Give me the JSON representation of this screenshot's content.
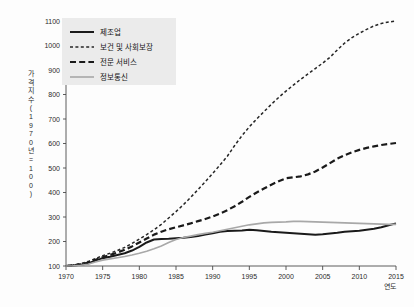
{
  "chart_data": {
    "type": "line",
    "title": "",
    "xlabel": "연도",
    "ylabel": "가격지수(1970년=100)",
    "ylabel_chars": [
      "가",
      "격",
      "지",
      "수",
      "(",
      "1",
      "9",
      "7",
      "0",
      "년",
      "=",
      "1",
      "0",
      "0",
      ")"
    ],
    "xlim": [
      1970,
      2015
    ],
    "ylim": [
      100,
      1100
    ],
    "xticks": [
      1970,
      1975,
      1980,
      1985,
      1990,
      1995,
      2000,
      2005,
      2010,
      2015
    ],
    "yticks": [
      100,
      200,
      300,
      400,
      500,
      600,
      700,
      800,
      900,
      1000,
      1100
    ],
    "grid": false,
    "legend_position": "top-left",
    "x": [
      1970,
      1971,
      1972,
      1973,
      1974,
      1975,
      1976,
      1977,
      1978,
      1979,
      1980,
      1981,
      1982,
      1983,
      1984,
      1985,
      1986,
      1987,
      1988,
      1989,
      1990,
      1991,
      1992,
      1993,
      1994,
      1995,
      1996,
      1997,
      1998,
      1999,
      2000,
      2001,
      2002,
      2003,
      2004,
      2005,
      2006,
      2007,
      2008,
      2009,
      2010,
      2011,
      2012,
      2013,
      2014,
      2015
    ],
    "series": [
      {
        "name": "제조업",
        "style": "solid",
        "color": "#1a1a1a",
        "width": 2.0,
        "values": [
          100,
          102,
          105,
          110,
          122,
          132,
          138,
          145,
          152,
          163,
          178,
          196,
          208,
          210,
          211,
          213,
          215,
          218,
          222,
          228,
          234,
          240,
          243,
          244,
          245,
          248,
          246,
          243,
          240,
          238,
          236,
          234,
          232,
          230,
          228,
          230,
          233,
          236,
          240,
          242,
          244,
          248,
          252,
          258,
          266,
          274
        ]
      },
      {
        "name": "보건 및 사회보장",
        "style": "short-dash",
        "color": "#262626",
        "width": 1.5,
        "values": [
          100,
          104,
          110,
          118,
          130,
          142,
          152,
          163,
          176,
          192,
          210,
          228,
          248,
          270,
          296,
          322,
          350,
          380,
          412,
          444,
          478,
          512,
          548,
          592,
          632,
          668,
          700,
          730,
          760,
          788,
          814,
          838,
          862,
          884,
          906,
          928,
          952,
          982,
          1010,
          1032,
          1050,
          1066,
          1080,
          1090,
          1096,
          1100
        ]
      },
      {
        "name": "전문 서비스",
        "style": "long-dash",
        "color": "#1a1a1a",
        "width": 2.2,
        "values": [
          100,
          103,
          107,
          114,
          125,
          136,
          145,
          155,
          166,
          180,
          196,
          212,
          228,
          240,
          250,
          258,
          266,
          274,
          283,
          292,
          302,
          314,
          328,
          344,
          362,
          382,
          400,
          416,
          432,
          446,
          458,
          462,
          466,
          474,
          486,
          502,
          520,
          538,
          552,
          564,
          574,
          582,
          588,
          594,
          598,
          602
        ]
      },
      {
        "name": "정보통신",
        "style": "solid",
        "color": "#a8a8a8",
        "width": 1.6,
        "values": [
          100,
          101,
          103,
          107,
          116,
          124,
          129,
          134,
          139,
          145,
          152,
          160,
          170,
          182,
          196,
          208,
          216,
          222,
          228,
          233,
          238,
          244,
          250,
          256,
          262,
          268,
          272,
          276,
          278,
          279,
          280,
          282,
          282,
          281,
          280,
          279,
          278,
          277,
          276,
          275,
          274,
          273,
          272,
          271,
          270,
          270
        ]
      }
    ]
  },
  "legend": {
    "items": [
      {
        "label": "제조업"
      },
      {
        "label": "보건 및 사회보장"
      },
      {
        "label": "전문 서비스"
      },
      {
        "label": "정보통신"
      }
    ]
  },
  "axes": {
    "x_name": "연도",
    "y_name": "가격지수(1970년=100)"
  }
}
